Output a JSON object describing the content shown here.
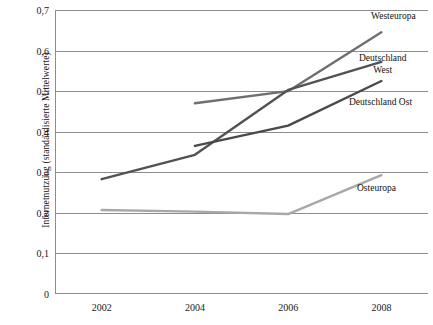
{
  "chart_data": {
    "type": "line",
    "title": "",
    "xlabel": "",
    "ylabel": "Internetnutzung (standardisierte Mittelwerte)",
    "categories": [
      "2002",
      "2004",
      "2006",
      "2008"
    ],
    "x": [
      2002,
      2004,
      2006,
      2008
    ],
    "xlim": [
      2001,
      2009
    ],
    "ylim": [
      0,
      0.7
    ],
    "y_tick_labels": [
      "0,7",
      "0,6",
      "0,5",
      "0,4",
      "0,3",
      "0,2",
      "0,1",
      "0"
    ],
    "y_tick_values": [
      0.7,
      0.6,
      0.5,
      0.4,
      0.3,
      0.2,
      0.1,
      0
    ],
    "grid": "horizontal",
    "legend": "inline-right-labels",
    "decimal_separator": ",",
    "series": [
      {
        "name": "Westeuropa",
        "label": "Westeuropa",
        "color": "#6f6f6f",
        "x": [
          2004,
          2006,
          2008
        ],
        "values": [
          0.47,
          0.5,
          0.645
        ]
      },
      {
        "name": "Deutschland West",
        "label": "Deutschland\nWest",
        "color": "#525252",
        "x": [
          2002,
          2004,
          2006,
          2008
        ],
        "values": [
          0.283,
          0.343,
          0.503,
          0.572
        ]
      },
      {
        "name": "Deutschland Ost",
        "label": "Deutschland Ost",
        "color": "#4a4a4a",
        "x": [
          2004,
          2006,
          2008
        ],
        "values": [
          0.365,
          0.415,
          0.525
        ]
      },
      {
        "name": "Osteuropa",
        "label": "Osteuropa",
        "color": "#a8a8a8",
        "x": [
          2002,
          2004,
          2006,
          2008
        ],
        "values": [
          0.207,
          0.203,
          0.197,
          0.293
        ]
      }
    ]
  },
  "axis": {
    "frame_color": "#8d8d8d",
    "grid_color": "#8d8d8d"
  }
}
